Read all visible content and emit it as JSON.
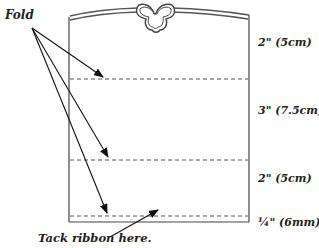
{
  "diagram": {
    "fold_label": "Fold",
    "tack_label": "Tack ribbon here.",
    "measurements": [
      {
        "label": "2\" (5cm)",
        "top": 36
      },
      {
        "label": "3\" (7.5cm)",
        "top": 104
      },
      {
        "label": "2\" (5cm)",
        "top": 172
      },
      {
        "label": "¼\" (6mm)",
        "top": 216
      }
    ],
    "colors": {
      "line": "#444444",
      "dash": "#555555",
      "text": "#222222",
      "background": "#ffffff"
    }
  }
}
